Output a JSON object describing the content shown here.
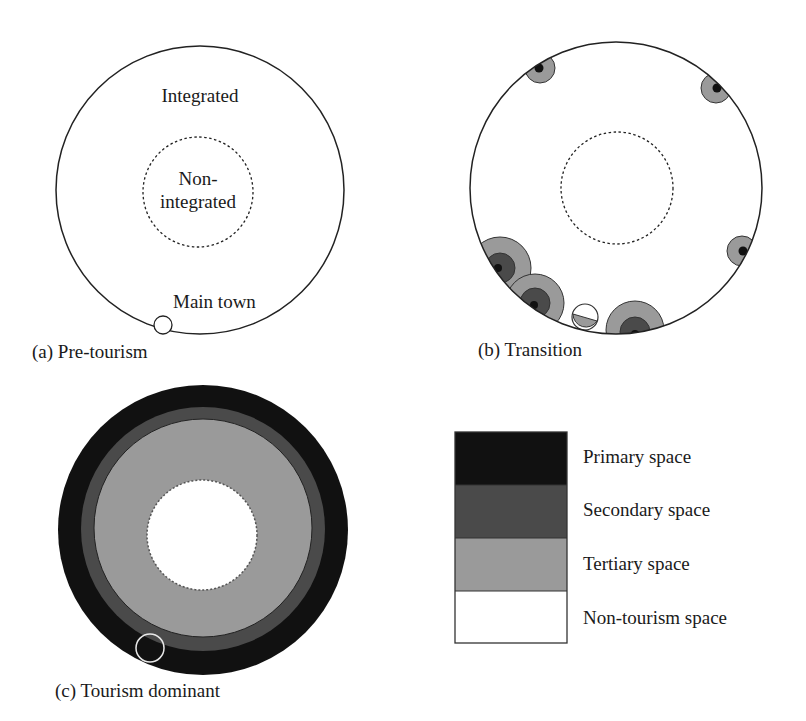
{
  "colors": {
    "primary": "#111111",
    "secondary": "#4a4a4a",
    "tertiary": "#9a9a9a",
    "non_tourism": "#ffffff",
    "outline": "#222222"
  },
  "panels": {
    "a": {
      "caption": "(a) Pre-tourism",
      "outer_label": "Integrated",
      "inner_label_line1": "Non-",
      "inner_label_line2": "integrated",
      "town_label": "Main town"
    },
    "b": {
      "caption": "(b) Transition"
    },
    "c": {
      "caption": "(c) Tourism dominant"
    }
  },
  "legend": {
    "items": [
      {
        "label": "Primary space",
        "color": "#111111"
      },
      {
        "label": "Secondary space",
        "color": "#4a4a4a"
      },
      {
        "label": "Tertiary space",
        "color": "#9a9a9a"
      },
      {
        "label": "Non-tourism space",
        "color": "#ffffff"
      }
    ]
  }
}
